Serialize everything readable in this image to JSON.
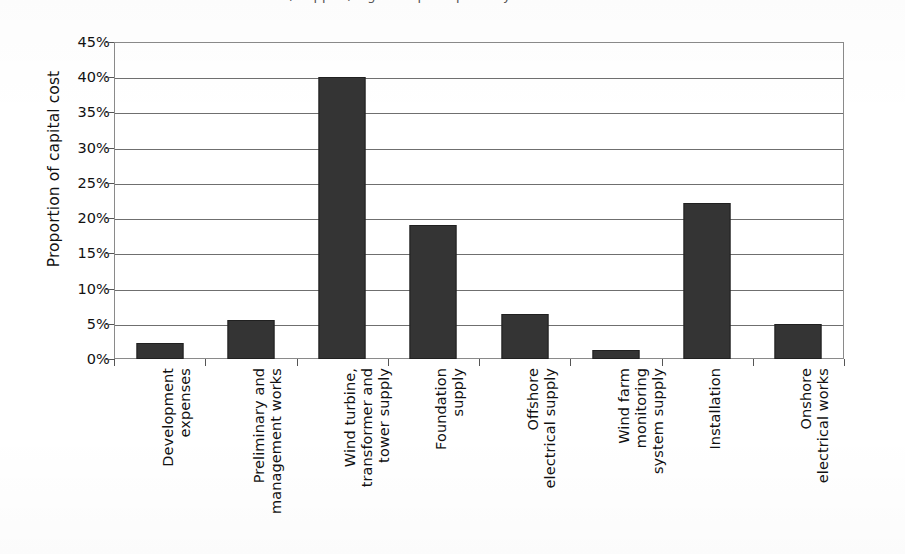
{
  "top_caption": "(cropped) Figure caption partially visible above chart",
  "chart_data": {
    "type": "bar",
    "title": "",
    "xlabel": "",
    "ylabel": "Proportion of capital cost",
    "categories": [
      "Development\nexpenses",
      "Preliminary and\nmanagement works",
      "Wind turbine,\ntransformer and\ntower supply",
      "Foundation\nsupply",
      "Offshore\nelectrical supply",
      "Wind farm\nmonitoring\nsystem supply",
      "Installation",
      "Onshore\nelectrical works"
    ],
    "values": [
      2.3,
      5.5,
      40.0,
      19.0,
      6.4,
      1.3,
      22.2,
      5.0
    ],
    "value_labels": [
      "2.3%",
      "5.5%",
      "40%",
      "19%",
      "6.4%",
      "1.3%",
      "22.2%",
      "5%"
    ],
    "ylim": [
      0,
      45
    ],
    "ytick_values": [
      0,
      5,
      10,
      15,
      20,
      25,
      30,
      35,
      40,
      45
    ],
    "ytick_labels": [
      "0%",
      "5%",
      "10%",
      "15%",
      "20%",
      "25%",
      "30%",
      "35%",
      "40%",
      "45%"
    ],
    "grid": true,
    "legend": false,
    "bar_color": "#343434",
    "axis_color": "#6f6f6f",
    "background": "#ffffff"
  }
}
